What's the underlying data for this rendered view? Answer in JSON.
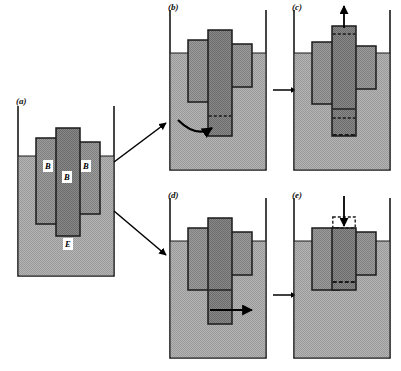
{
  "figure": {
    "title": "",
    "background": "#ffffff",
    "colors": {
      "liquid": "#a9a9a9",
      "block_light": "#989898",
      "block_dark": "#7d7d7d",
      "outline": "#1a1a1a",
      "label_bg": "#ffffff",
      "arrow": "#000000"
    }
  },
  "panels": [
    {
      "id": "a",
      "label": "(a)",
      "labels_in_panel": [
        {
          "text": "B",
          "name": "block-label-left"
        },
        {
          "text": "B",
          "name": "block-label-center"
        },
        {
          "text": "B",
          "name": "block-label-right"
        },
        {
          "text": "E",
          "name": "medium-label"
        }
      ],
      "description": "Three blocks B embedded in medium E inside open container"
    },
    {
      "id": "b",
      "label": "(b)",
      "labels_in_panel": [],
      "description": "Center block lowered; curved arrow indicates lateral force"
    },
    {
      "id": "c",
      "label": "(c)",
      "labels_in_panel": [],
      "description": "Center block pulled up; vertical arrow up, dashed original outlines"
    },
    {
      "id": "d",
      "label": "(d)",
      "labels_in_panel": [],
      "description": "Center block lowered; straight arrow indicates lateral force"
    },
    {
      "id": "e",
      "label": "(e)",
      "labels_in_panel": [],
      "description": "Center block pushed down; vertical arrow down, dashed original outlines"
    }
  ],
  "flow_arrows": [
    {
      "name": "arrow-a-to-b",
      "from": "a",
      "to": "b",
      "style": "diagonal-up"
    },
    {
      "name": "arrow-a-to-d",
      "from": "a",
      "to": "d",
      "style": "diagonal-down"
    },
    {
      "name": "arrow-b-to-c",
      "from": "b",
      "to": "c",
      "style": "horizontal"
    },
    {
      "name": "arrow-d-to-e",
      "from": "d",
      "to": "e",
      "style": "horizontal"
    }
  ]
}
